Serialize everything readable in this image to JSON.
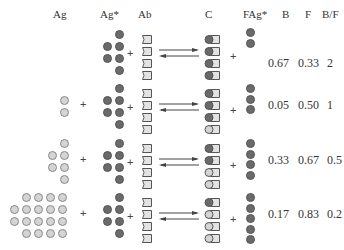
{
  "headers": {
    "ag": "Ag",
    "ag_star": "Ag*",
    "ab": "Ab",
    "c": "C",
    "fag_star": "FAg*",
    "b": "B",
    "f": "F",
    "bf": "B/F"
  },
  "plus": "+",
  "colors": {
    "labeled_antigen": "#6a6a6a",
    "unlabeled_antigen": "#d4d4d4",
    "antibody": "#e0e0e0",
    "outline": "#555555"
  },
  "rows": [
    {
      "ag_count": 0,
      "ag_star_count": 6,
      "ab_count": 4,
      "c_labeled": 4,
      "c_unlabeled": 0,
      "fag_star_count": 2,
      "b": "0.67",
      "f": "0.33",
      "bf": "2"
    },
    {
      "ag_count": 2,
      "ag_star_count": 6,
      "ab_count": 4,
      "c_labeled": 3,
      "c_unlabeled": 1,
      "fag_star_count": 3,
      "b": "0.05",
      "f": "0.50",
      "bf": "1"
    },
    {
      "ag_count": 8,
      "ag_star_count": 6,
      "ab_count": 4,
      "c_labeled": 2,
      "c_unlabeled": 2,
      "fag_star_count": 4,
      "b": "0.33",
      "f": "0.67",
      "bf": "0.5"
    },
    {
      "ag_count": 18,
      "ag_star_count": 6,
      "ab_count": 4,
      "c_labeled": 1,
      "c_unlabeled": 3,
      "fag_star_count": 5,
      "b": "0.17",
      "f": "0.83",
      "bf": "0.2"
    }
  ]
}
